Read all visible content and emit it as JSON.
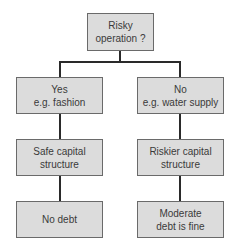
{
  "diagram": {
    "root": {
      "label": "Risky\noperation ?"
    },
    "branches": [
      {
        "answer": "Yes\ne.g. fashion",
        "structure": "Safe capital\nstructure",
        "outcome": "No debt"
      },
      {
        "answer": "No\ne.g. water supply",
        "structure": "Riskier capital\nstructure",
        "outcome": "Moderate\ndebt is fine"
      }
    ],
    "colors": {
      "box_fill": "#dcdcdc",
      "box_border": "#6a6a6a",
      "connector": "#2a2a2a"
    }
  }
}
